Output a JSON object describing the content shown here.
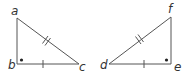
{
  "figure": {
    "colors": {
      "line": "#555555",
      "label": "#333333",
      "background": "#ffffff"
    },
    "triangles": [
      {
        "name": "abc",
        "vertices": [
          {
            "label": "a",
            "x": 17,
            "y": 18
          },
          {
            "label": "b",
            "x": 17,
            "y": 64
          },
          {
            "label": "c",
            "x": 79,
            "y": 64
          }
        ],
        "right_angle_at": "b",
        "hypotenuse_marks": 2,
        "base_marks": 1
      },
      {
        "name": "def",
        "vertices": [
          {
            "label": "d",
            "x": 109,
            "y": 64
          },
          {
            "label": "e",
            "x": 171,
            "y": 64
          },
          {
            "label": "f",
            "x": 171,
            "y": 17
          }
        ],
        "right_angle_at": "e",
        "hypotenuse_marks": 2,
        "base_marks": 1
      }
    ],
    "labels": {
      "a": "a",
      "b": "b",
      "c": "c",
      "d": "d",
      "e": "e",
      "f": "f"
    }
  }
}
